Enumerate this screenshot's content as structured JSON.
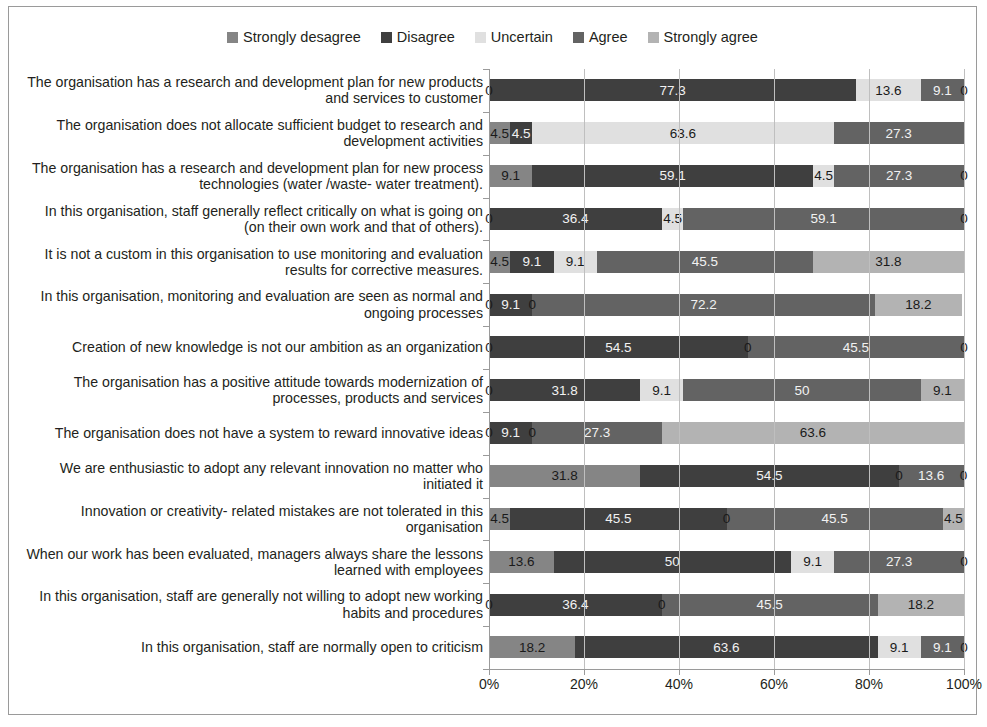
{
  "chart_data": {
    "type": "bar",
    "orientation": "horizontal",
    "stacked": true,
    "stack_total_percent": 100,
    "title": "",
    "subtitle": "",
    "xlabel": "",
    "ylabel": "",
    "xlim": [
      0,
      100
    ],
    "xticks": [
      0,
      20,
      40,
      60,
      80,
      100
    ],
    "xtick_labels": [
      "0%",
      "20%",
      "40%",
      "60%",
      "80%",
      "100%"
    ],
    "grid": true,
    "grid_axis": "x",
    "legend_position": "top-center",
    "legend": [
      "Strongly desagree",
      "Disagree",
      "Uncertain",
      "Agree",
      "Strongly agree"
    ],
    "colors": [
      "#858585",
      "#3f3f3f",
      "#e0e0e0",
      "#636363",
      "#b3b3b3"
    ],
    "categories": [
      "The organisation has a research and development plan for new products and services to customer",
      "The organisation does not allocate sufficient budget to research and development activities",
      "The organisation has a research and development plan for new process technologies (water /waste- water treatment).",
      "In this organisation, staff generally reflect critically on what is going on (on their own work and that of others).",
      "It is not a custom in this organisation to use monitoring and evaluation results for corrective measures.",
      "In this organisation, monitoring and evaluation are seen as normal and ongoing processes",
      "Creation of new knowledge is not our ambition as an organization",
      "The organisation has a positive attitude towards modernization of processes, products and services",
      "The organisation does not have a system to reward innovative ideas",
      "We are enthusiastic to adopt any relevant innovation no matter who initiated it",
      "Innovation or creativity- related mistakes are not tolerated in this organisation",
      "When our work has been evaluated, managers always share the lessons learned with employees",
      "In this organisation, staff are generally not willing to adopt new working habits and procedures",
      "In this organisation, staff are normally open to criticism"
    ],
    "series": [
      {
        "name": "Strongly desagree",
        "color": "#858585",
        "values": [
          0,
          4.5,
          9.1,
          0,
          4.5,
          0,
          0,
          0,
          0,
          31.8,
          4.5,
          13.6,
          0,
          18.2
        ]
      },
      {
        "name": "Disagree",
        "color": "#3f3f3f",
        "values": [
          77.3,
          4.5,
          59.1,
          36.4,
          9.1,
          9.1,
          54.5,
          31.8,
          9.1,
          54.5,
          45.5,
          50,
          36.4,
          63.6
        ]
      },
      {
        "name": "Uncertain",
        "color": "#e0e0e0",
        "values": [
          13.6,
          63.6,
          4.5,
          4.5,
          9.1,
          0,
          0,
          9.1,
          0,
          0,
          0,
          9.1,
          0,
          9.1
        ]
      },
      {
        "name": "Agree",
        "color": "#636363",
        "values": [
          9.1,
          27.3,
          27.3,
          59.1,
          45.5,
          72.2,
          45.5,
          50,
          27.3,
          13.6,
          45.5,
          27.3,
          45.5,
          9.1
        ]
      },
      {
        "name": "Strongly agree",
        "color": "#b3b3b3",
        "values": [
          0,
          0,
          0,
          0,
          31.8,
          18.2,
          0,
          9.1,
          63.6,
          0,
          4.5,
          0,
          18.2,
          0
        ]
      }
    ],
    "data_labels": [
      [
        "0",
        "77.3",
        "13.6",
        "9.1",
        "0"
      ],
      [
        "4.5",
        "4.5",
        "63.6",
        "27.3",
        ""
      ],
      [
        "9.1",
        "59.1",
        "4.5",
        "27.3",
        "0"
      ],
      [
        "0",
        "36.4",
        "4.5",
        "59.1",
        "0"
      ],
      [
        "4.5",
        "9.1",
        "9.1",
        "45.5",
        "31.8"
      ],
      [
        "0",
        "9.1",
        "0",
        "72.2",
        "18.2"
      ],
      [
        "0",
        "54.5",
        "0",
        "45.5",
        "0"
      ],
      [
        "0",
        "31.8",
        "9.1",
        "50",
        "9.1"
      ],
      [
        "0",
        "9.1",
        "0",
        "27.3",
        "63.6"
      ],
      [
        "31.8",
        "54.5",
        "0",
        "13.6",
        "0"
      ],
      [
        "4.5",
        "45.5",
        "0",
        "45.5",
        "4.5"
      ],
      [
        "13.6",
        "50",
        "9.1",
        "27.3",
        "0"
      ],
      [
        "0",
        "36.4",
        "0",
        "45.5",
        "18.2"
      ],
      [
        "18.2",
        "63.6",
        "9.1",
        "9.1",
        "0"
      ]
    ]
  }
}
